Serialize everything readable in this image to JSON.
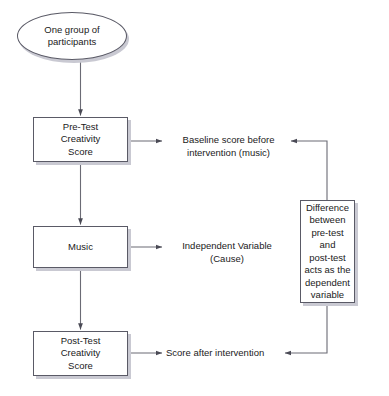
{
  "diagram": {
    "type": "flowchart",
    "background_color": "#ffffff",
    "node_fill_color": "#ffffff",
    "node_border_color": "#5a5a66",
    "node_shadow_color": "#c9c9d2",
    "connector_color": "#6b6b75",
    "nodes": {
      "participants": {
        "shape": "ellipse",
        "label": "One group of\nparticipants"
      },
      "pre_test": {
        "shape": "rectangle",
        "label": "Pre-Test\nCreativity\nScore"
      },
      "music": {
        "shape": "rectangle",
        "label": "Music"
      },
      "post_test": {
        "shape": "rectangle",
        "label": "Post-Test\nCreativity\nScore"
      },
      "difference": {
        "shape": "rectangle",
        "label": "Difference\nbetween\npre-test and\npost-test\nacts as the\ndependent\nvariable"
      }
    },
    "labels": {
      "baseline": "Baseline score before\nintervention (music)",
      "independent": "Independent Variable\n(Cause)",
      "after": "Score after intervention"
    },
    "connectors": [
      {
        "name": "participants-to-pre-test",
        "from": "participants",
        "to": "pre_test",
        "arrow": "end"
      },
      {
        "name": "pre-test-to-music",
        "from": "pre_test",
        "to": "music",
        "arrow": "end"
      },
      {
        "name": "music-to-post-test",
        "from": "music",
        "to": "post_test",
        "arrow": "end"
      },
      {
        "name": "pre-test-to-baseline",
        "from": "pre_test",
        "to": "baseline",
        "arrow": "end"
      },
      {
        "name": "music-to-independent",
        "from": "music",
        "to": "independent",
        "arrow": "end"
      },
      {
        "name": "post-test-to-after",
        "from": "post_test",
        "to": "after",
        "arrow": "end"
      },
      {
        "name": "difference-to-baseline",
        "from": "difference",
        "to": "baseline",
        "arrow": "end"
      },
      {
        "name": "difference-to-after",
        "from": "difference",
        "to": "after",
        "arrow": "end"
      }
    ]
  }
}
